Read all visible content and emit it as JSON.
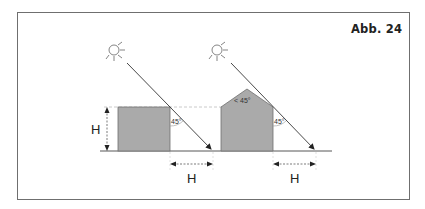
{
  "figure": {
    "label": "Abb. 24",
    "colors": {
      "building_fill": "#aaaaaa",
      "building_stroke": "#6f6f6f",
      "line": "#333333",
      "dashed": "#bdbdbd",
      "frame": "#6f6f6f"
    }
  },
  "left_scene": {
    "height_label": "H",
    "angle_label": "45°",
    "distance_label": "H",
    "sun_icon": "sun-icon"
  },
  "right_scene": {
    "roof_angle_label": "< 45°",
    "angle_label": "45°",
    "distance_label": "H",
    "sun_icon": "sun-icon"
  }
}
